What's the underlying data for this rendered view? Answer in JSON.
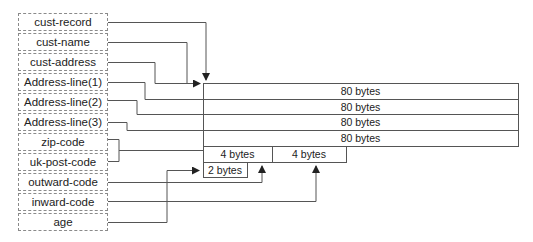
{
  "fields": [
    {
      "name": "cust-record"
    },
    {
      "name": "cust-name"
    },
    {
      "name": "cust-address"
    },
    {
      "name": "Address-line(1)"
    },
    {
      "name": "Address-line(2)"
    },
    {
      "name": "Address-line(3)"
    },
    {
      "name": "zip-code"
    },
    {
      "name": "uk-post-code"
    },
    {
      "name": "outward-code"
    },
    {
      "name": "inward-code"
    },
    {
      "name": "age"
    }
  ],
  "memory": {
    "rows": [
      {
        "label": "80 bytes"
      },
      {
        "label": "80 bytes"
      },
      {
        "label": "80 bytes"
      },
      {
        "label": "80 bytes"
      }
    ],
    "small_cells": [
      {
        "label": "4 bytes"
      },
      {
        "label": "4 bytes"
      },
      {
        "label": "2 bytes"
      }
    ]
  },
  "colors": {
    "line": "#555555",
    "border": "#8a8a8a"
  }
}
